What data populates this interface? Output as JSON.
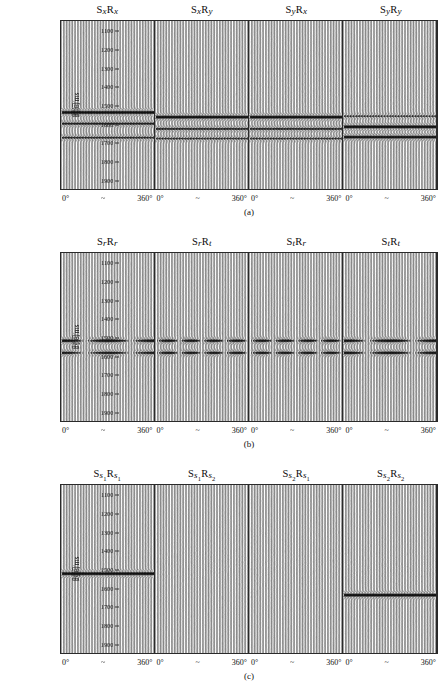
{
  "figure": {
    "axis": {
      "ylabel": "时间/ms",
      "yticks": [
        1100,
        1200,
        1300,
        1400,
        1500,
        1600,
        1700,
        1800,
        1900
      ],
      "ylim": [
        1050,
        1950
      ],
      "xstart_label": "0°",
      "xmid_label": "~",
      "xend_label": "360°"
    },
    "panels": [
      {
        "caption": "(a)",
        "columns": [
          {
            "s": "x",
            "r": "x",
            "label": "SxRx"
          },
          {
            "s": "x",
            "r": "y",
            "label": "SxRy"
          },
          {
            "s": "y",
            "r": "x",
            "label": "SyRx"
          },
          {
            "s": "y",
            "r": "y",
            "label": "SyRy"
          }
        ]
      },
      {
        "caption": "(b)",
        "columns": [
          {
            "s": "r",
            "r": "r",
            "label": "SrRr"
          },
          {
            "s": "r",
            "r": "t",
            "label": "SrRt"
          },
          {
            "s": "t",
            "r": "r",
            "label": "StRr"
          },
          {
            "s": "t",
            "r": "t",
            "label": "StRt"
          }
        ]
      },
      {
        "caption": "(c)",
        "columns": [
          {
            "s": "s",
            "ssub": "1",
            "r": "s",
            "rsub": "1",
            "label": "Ss1Rs1"
          },
          {
            "s": "s",
            "ssub": "1",
            "r": "s",
            "rsub": "2",
            "label": "Ss1Rs2"
          },
          {
            "s": "s",
            "ssub": "2",
            "r": "s",
            "rsub": "1",
            "label": "Ss2Rs1"
          },
          {
            "s": "s",
            "ssub": "2",
            "r": "s",
            "rsub": "2",
            "label": "Ss2Rs2"
          }
        ]
      }
    ]
  },
  "chart_data": {
    "type": "line",
    "xlabel": "方位角 0° ~ 360°",
    "ylabel": "时间/ms",
    "ylim": [
      1050,
      1950
    ],
    "yticks": [
      1100,
      1200,
      1300,
      1400,
      1500,
      1600,
      1700,
      1800,
      1900
    ],
    "xlim": [
      0,
      360
    ],
    "grid": false,
    "legend": "none",
    "traces_per_subpanel": 60,
    "background_noise_amplitude": 0.12,
    "panels": [
      {
        "caption": "(a)",
        "system": "x-y survey coordinates",
        "subpanels": [
          {
            "label": "SxRx",
            "events": [
              {
                "time_ms": 1540,
                "amplitude": 1.0,
                "modulation": "constant",
                "azimuth_dependence": "none"
              },
              {
                "time_ms": 1600,
                "amplitude": 0.55,
                "modulation": "constant",
                "azimuth_dependence": "none"
              },
              {
                "time_ms": 1675,
                "amplitude": 0.45,
                "modulation": "constant",
                "azimuth_dependence": "none"
              }
            ]
          },
          {
            "label": "SxRy",
            "events": [
              {
                "time_ms": 1565,
                "amplitude": 0.95,
                "modulation": "constant",
                "azimuth_dependence": "none"
              },
              {
                "time_ms": 1628,
                "amplitude": 0.5,
                "modulation": "constant",
                "azimuth_dependence": "none"
              },
              {
                "time_ms": 1680,
                "amplitude": 0.4,
                "modulation": "constant",
                "azimuth_dependence": "none"
              }
            ]
          },
          {
            "label": "SyRx",
            "events": [
              {
                "time_ms": 1565,
                "amplitude": 0.95,
                "modulation": "constant",
                "azimuth_dependence": "none"
              },
              {
                "time_ms": 1628,
                "amplitude": 0.5,
                "modulation": "constant",
                "azimuth_dependence": "none"
              },
              {
                "time_ms": 1680,
                "amplitude": 0.4,
                "modulation": "constant",
                "azimuth_dependence": "none"
              }
            ]
          },
          {
            "label": "SyRy",
            "events": [
              {
                "time_ms": 1560,
                "amplitude": 0.35,
                "modulation": "constant",
                "azimuth_dependence": "none"
              },
              {
                "time_ms": 1617,
                "amplitude": 1.0,
                "modulation": "constant",
                "azimuth_dependence": "none"
              },
              {
                "time_ms": 1672,
                "amplitude": 0.85,
                "modulation": "constant",
                "azimuth_dependence": "none"
              }
            ]
          }
        ]
      },
      {
        "caption": "(b)",
        "system": "radial-transverse coordinates",
        "subpanels": [
          {
            "label": "SrRr",
            "events": [
              {
                "time_ms": 1520,
                "amplitude": 0.9,
                "modulation": "cos2",
                "periods": 2,
                "azimuth_dependence": "strong"
              },
              {
                "time_ms": 1585,
                "amplitude": 0.7,
                "modulation": "cos2",
                "periods": 2,
                "azimuth_dependence": "strong"
              }
            ]
          },
          {
            "label": "SrRt",
            "events": [
              {
                "time_ms": 1520,
                "amplitude": 0.8,
                "modulation": "sin2",
                "periods": 4,
                "azimuth_dependence": "strong"
              },
              {
                "time_ms": 1585,
                "amplitude": 0.75,
                "modulation": "sin2",
                "periods": 4,
                "azimuth_dependence": "strong"
              }
            ]
          },
          {
            "label": "StRr",
            "events": [
              {
                "time_ms": 1520,
                "amplitude": 0.8,
                "modulation": "sin2",
                "periods": 4,
                "azimuth_dependence": "strong"
              },
              {
                "time_ms": 1585,
                "amplitude": 0.75,
                "modulation": "sin2",
                "periods": 4,
                "azimuth_dependence": "strong"
              }
            ]
          },
          {
            "label": "StRt",
            "events": [
              {
                "time_ms": 1520,
                "amplitude": 0.9,
                "modulation": "cos2",
                "periods": 2,
                "azimuth_dependence": "strong"
              },
              {
                "time_ms": 1585,
                "amplitude": 0.85,
                "modulation": "cos2",
                "periods": 2,
                "azimuth_dependence": "strong"
              }
            ]
          }
        ]
      },
      {
        "caption": "(c)",
        "system": "principal (fast s1 / slow s2) coordinates",
        "subpanels": [
          {
            "label": "Ss1Rs1",
            "events": [
              {
                "time_ms": 1525,
                "amplitude": 1.0,
                "modulation": "constant",
                "azimuth_dependence": "none",
                "note": "fast split shear wave"
              }
            ]
          },
          {
            "label": "Ss1Rs2",
            "events": []
          },
          {
            "label": "Ss2Rs1",
            "events": []
          },
          {
            "label": "Ss2Rs2",
            "events": [
              {
                "time_ms": 1640,
                "amplitude": 1.0,
                "modulation": "constant",
                "azimuth_dependence": "none",
                "note": "slow split shear wave"
              }
            ]
          }
        ]
      }
    ]
  }
}
